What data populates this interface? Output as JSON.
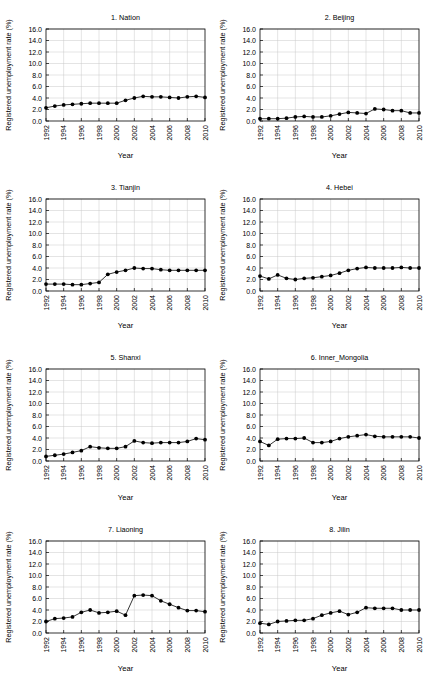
{
  "figure": {
    "panel_count": 8,
    "columns": 2,
    "rows": 4,
    "background_color": "#ffffff",
    "line_color": "#000000",
    "grid_color": "#c8c8c8"
  },
  "axes_common": {
    "ylabel": "Registered unemployment rate (%)",
    "xlabel": "Year",
    "ylim": [
      0,
      16
    ],
    "yticks": [
      0,
      2,
      4,
      6,
      8,
      10,
      12,
      14,
      16
    ],
    "ytick_labels": [
      "0.0",
      "2.0",
      "4.0",
      "6.0",
      "8.0",
      "10.0",
      "12.0",
      "14.0",
      "16.0"
    ],
    "xlim": [
      1992,
      2010
    ],
    "xticks": [
      1992,
      1994,
      1996,
      1998,
      2000,
      2002,
      2004,
      2006,
      2008,
      2010
    ],
    "xtick_labels": [
      "1992",
      "1994",
      "1996",
      "1998",
      "2000",
      "2002",
      "2004",
      "2006",
      "2008",
      "2010"
    ],
    "grid": true,
    "legend": "none",
    "marker": "filled-circle"
  },
  "chart_data": [
    {
      "type": "line",
      "title": "1. Nation",
      "xlabel": "Year",
      "ylabel": "Registered unemployment rate (%)",
      "ylim": [
        0,
        16
      ],
      "xlim": [
        1992,
        2010
      ],
      "x": [
        1992,
        1993,
        1994,
        1995,
        1996,
        1997,
        1998,
        1999,
        2000,
        2001,
        2002,
        2003,
        2004,
        2005,
        2006,
        2007,
        2008,
        2009,
        2010
      ],
      "values": [
        2.3,
        2.6,
        2.8,
        2.9,
        3.0,
        3.1,
        3.1,
        3.1,
        3.1,
        3.6,
        4.0,
        4.3,
        4.2,
        4.2,
        4.1,
        4.0,
        4.2,
        4.3,
        4.1
      ]
    },
    {
      "type": "line",
      "title": "2. Beijing",
      "xlabel": "Year",
      "ylabel": "Registered unemployment rate (%)",
      "ylim": [
        0,
        16
      ],
      "xlim": [
        1992,
        2010
      ],
      "x": [
        1992,
        1993,
        1994,
        1995,
        1996,
        1997,
        1998,
        1999,
        2000,
        2001,
        2002,
        2003,
        2004,
        2005,
        2006,
        2007,
        2008,
        2009,
        2010
      ],
      "values": [
        0.4,
        0.4,
        0.4,
        0.5,
        0.7,
        0.8,
        0.7,
        0.7,
        0.9,
        1.2,
        1.5,
        1.4,
        1.3,
        2.1,
        2.0,
        1.8,
        1.8,
        1.4,
        1.4
      ]
    },
    {
      "type": "line",
      "title": "3. Tianjin",
      "xlabel": "Year",
      "ylabel": "Registered unemployment rate (%)",
      "ylim": [
        0,
        16
      ],
      "xlim": [
        1992,
        2010
      ],
      "x": [
        1992,
        1993,
        1994,
        1995,
        1996,
        1997,
        1998,
        1999,
        2000,
        2001,
        2002,
        2003,
        2004,
        2005,
        2006,
        2007,
        2008,
        2009,
        2010
      ],
      "values": [
        1.2,
        1.2,
        1.2,
        1.1,
        1.1,
        1.3,
        1.5,
        2.9,
        3.3,
        3.6,
        4.0,
        3.9,
        3.9,
        3.7,
        3.6,
        3.6,
        3.6,
        3.6,
        3.6
      ]
    },
    {
      "type": "line",
      "title": "4. Hebei",
      "xlabel": "Year",
      "ylabel": "Registered unemployment rate (%)",
      "ylim": [
        0,
        16
      ],
      "xlim": [
        1992,
        2010
      ],
      "x": [
        1992,
        1993,
        1994,
        1995,
        1996,
        1997,
        1998,
        1999,
        2000,
        2001,
        2002,
        2003,
        2004,
        2005,
        2006,
        2007,
        2008,
        2009,
        2010
      ],
      "values": [
        2.6,
        2.1,
        2.8,
        2.2,
        2.0,
        2.2,
        2.3,
        2.5,
        2.7,
        3.1,
        3.6,
        3.9,
        4.1,
        4.0,
        4.0,
        4.0,
        4.1,
        4.0,
        4.0
      ]
    },
    {
      "type": "line",
      "title": "5. Shanxi",
      "xlabel": "Year",
      "ylabel": "Registered unemployment rate (%)",
      "ylim": [
        0,
        16
      ],
      "xlim": [
        1992,
        2010
      ],
      "x": [
        1992,
        1993,
        1994,
        1995,
        1996,
        1997,
        1998,
        1999,
        2000,
        2001,
        2002,
        2003,
        2004,
        2005,
        2006,
        2007,
        2008,
        2009,
        2010
      ],
      "values": [
        0.8,
        1.0,
        1.2,
        1.5,
        1.8,
        2.5,
        2.3,
        2.2,
        2.2,
        2.5,
        3.5,
        3.2,
        3.1,
        3.2,
        3.2,
        3.2,
        3.4,
        3.9,
        3.7
      ]
    },
    {
      "type": "line",
      "title": "6. Inner_Mongolia",
      "xlabel": "Year",
      "ylabel": "Registered unemployment rate (%)",
      "ylim": [
        0,
        16
      ],
      "xlim": [
        1992,
        2010
      ],
      "x": [
        1992,
        1993,
        1994,
        1995,
        1996,
        1997,
        1998,
        1999,
        2000,
        2001,
        2002,
        2003,
        2004,
        2005,
        2006,
        2007,
        2008,
        2009,
        2010
      ],
      "values": [
        3.4,
        2.7,
        3.8,
        3.9,
        3.9,
        4.0,
        3.2,
        3.2,
        3.4,
        3.9,
        4.2,
        4.4,
        4.6,
        4.3,
        4.2,
        4.2,
        4.2,
        4.2,
        4.0
      ]
    },
    {
      "type": "line",
      "title": "7. Liaoning",
      "xlabel": "Year",
      "ylabel": "Registered unemployment rate (%)",
      "ylim": [
        0,
        16
      ],
      "xlim": [
        1992,
        2010
      ],
      "x": [
        1992,
        1993,
        1994,
        1995,
        1996,
        1997,
        1998,
        1999,
        2000,
        2001,
        2002,
        2003,
        2004,
        2005,
        2006,
        2007,
        2008,
        2009,
        2010
      ],
      "values": [
        2.0,
        2.5,
        2.6,
        2.8,
        3.6,
        4.0,
        3.5,
        3.6,
        3.8,
        3.1,
        6.5,
        6.6,
        6.5,
        5.6,
        5.0,
        4.4,
        3.9,
        3.9,
        3.7
      ]
    },
    {
      "type": "line",
      "title": "8. Jilin",
      "xlabel": "Year",
      "ylabel": "Registered unemployment rate (%)",
      "ylim": [
        0,
        16
      ],
      "xlim": [
        1992,
        2010
      ],
      "x": [
        1992,
        1993,
        1994,
        1995,
        1996,
        1997,
        1998,
        1999,
        2000,
        2001,
        2002,
        2003,
        2004,
        2005,
        2006,
        2007,
        2008,
        2009,
        2010
      ],
      "values": [
        1.7,
        1.5,
        2.0,
        2.1,
        2.2,
        2.2,
        2.5,
        3.1,
        3.5,
        3.8,
        3.2,
        3.6,
        4.4,
        4.3,
        4.3,
        4.3,
        4.0,
        4.0,
        4.0
      ]
    }
  ]
}
